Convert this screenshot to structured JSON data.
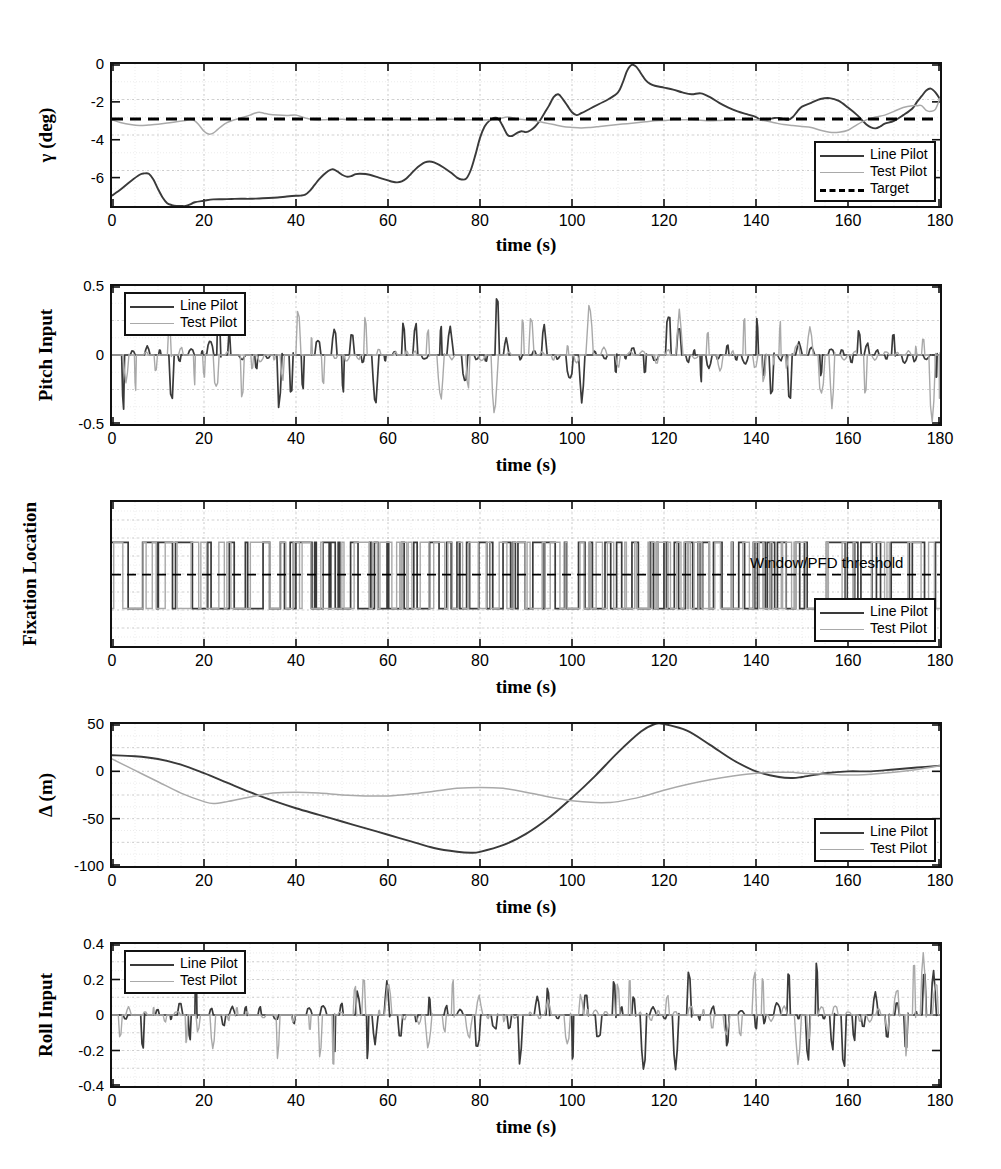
{
  "figure": {
    "shared_xlabel": "time (s)",
    "xticks": [
      0,
      20,
      40,
      60,
      80,
      100,
      120,
      140,
      160,
      180
    ],
    "xlim": [
      0,
      180
    ],
    "series_names": {
      "line": "Line Pilot",
      "test": "Test Pilot",
      "target": "Target"
    },
    "colors": {
      "line_pilot": "#3a3a3a",
      "test_pilot": "#a9a9a9",
      "target": "#000000",
      "grid": "#d8d8d8",
      "axis": "#111111"
    }
  },
  "chart_data": [
    {
      "id": "gamma",
      "type": "line",
      "title": "",
      "xlabel": "time (s)",
      "ylabel": "γ (deg)",
      "xlim": [
        0,
        180
      ],
      "ylim": [
        -7.5,
        0
      ],
      "xticks": [
        0,
        20,
        40,
        60,
        80,
        100,
        120,
        140,
        160,
        180
      ],
      "yticks": [
        0,
        -2,
        -4,
        -6
      ],
      "grid": true,
      "legend": {
        "position": "bottom-right",
        "entries": [
          "Line Pilot",
          "Test Pilot",
          "Target"
        ]
      },
      "series": [
        {
          "name": "Line Pilot",
          "style": "solid-dark",
          "x": [
            0,
            2,
            4,
            6,
            7,
            8,
            9,
            10,
            11,
            12,
            13,
            14,
            15,
            16,
            17,
            18,
            20,
            22,
            24,
            26,
            28,
            30,
            32,
            34,
            36,
            38,
            40,
            41,
            42,
            43,
            44,
            45,
            46,
            47,
            48,
            49,
            50,
            51,
            52,
            53,
            54,
            56,
            58,
            60,
            61,
            62,
            63,
            64,
            65,
            66,
            67,
            68,
            69,
            70,
            72,
            74,
            75,
            76,
            77,
            78,
            79,
            80,
            81,
            82,
            83,
            84,
            85,
            86,
            87,
            88,
            89,
            90,
            91,
            92,
            93,
            94,
            95,
            96,
            97,
            98,
            99,
            100,
            101,
            102,
            104,
            106,
            108,
            110,
            111,
            112,
            113,
            114,
            115,
            116,
            117,
            118,
            120,
            122,
            124,
            126,
            128,
            130,
            132,
            134,
            136,
            138,
            140,
            141,
            142,
            143,
            144,
            145,
            146,
            147,
            148,
            149,
            150,
            152,
            154,
            156,
            158,
            160,
            162,
            163,
            164,
            165,
            166,
            167,
            168,
            170,
            172,
            174,
            175,
            176,
            177,
            178,
            179,
            180
          ],
          "y": [
            -6.95,
            -6.6,
            -6.2,
            -5.85,
            -5.78,
            -5.8,
            -6.1,
            -6.6,
            -7.05,
            -7.35,
            -7.45,
            -7.5,
            -7.5,
            -7.5,
            -7.42,
            -7.3,
            -7.22,
            -7.15,
            -7.14,
            -7.13,
            -7.12,
            -7.12,
            -7.1,
            -7.08,
            -7.05,
            -7.0,
            -6.96,
            -6.95,
            -6.9,
            -6.7,
            -6.4,
            -6.1,
            -5.85,
            -5.65,
            -5.55,
            -5.68,
            -5.85,
            -5.95,
            -5.92,
            -5.82,
            -5.8,
            -5.85,
            -6.0,
            -6.15,
            -6.22,
            -6.25,
            -6.2,
            -6.05,
            -5.8,
            -5.55,
            -5.35,
            -5.2,
            -5.15,
            -5.2,
            -5.45,
            -5.8,
            -6.0,
            -6.1,
            -6.05,
            -5.6,
            -4.8,
            -3.9,
            -3.3,
            -3.0,
            -2.85,
            -2.9,
            -3.3,
            -3.75,
            -3.8,
            -3.65,
            -3.55,
            -3.6,
            -3.5,
            -3.3,
            -3.0,
            -2.6,
            -2.2,
            -1.75,
            -1.6,
            -1.85,
            -2.2,
            -2.55,
            -2.7,
            -2.6,
            -2.35,
            -2.1,
            -1.85,
            -1.5,
            -1.0,
            -0.35,
            -0.05,
            -0.15,
            -0.5,
            -0.85,
            -1.05,
            -1.15,
            -1.25,
            -1.35,
            -1.5,
            -1.6,
            -1.55,
            -1.75,
            -2.05,
            -2.3,
            -2.5,
            -2.65,
            -2.8,
            -2.95,
            -2.95,
            -2.9,
            -2.85,
            -2.85,
            -2.9,
            -2.95,
            -2.8,
            -2.5,
            -2.25,
            -2.05,
            -1.85,
            -1.8,
            -1.95,
            -2.3,
            -2.7,
            -2.95,
            -3.2,
            -3.35,
            -3.4,
            -3.3,
            -3.15,
            -3.0,
            -2.7,
            -2.35,
            -2.0,
            -1.7,
            -1.4,
            -1.3,
            -1.5,
            -1.85
          ]
        },
        {
          "name": "Test Pilot",
          "style": "solid-light",
          "x": [
            0,
            2,
            4,
            6,
            8,
            10,
            12,
            14,
            16,
            17,
            18,
            19,
            20,
            21,
            22,
            23,
            24,
            25,
            26,
            28,
            30,
            31,
            32,
            33,
            34,
            36,
            38,
            40,
            42,
            44,
            46,
            48,
            50,
            52,
            54,
            56,
            58,
            60,
            62,
            64,
            66,
            68,
            70,
            72,
            74,
            76,
            78,
            80,
            82,
            84,
            86,
            88,
            90,
            92,
            94,
            96,
            98,
            100,
            102,
            104,
            106,
            108,
            110,
            112,
            114,
            116,
            118,
            120,
            122,
            124,
            126,
            128,
            130,
            132,
            134,
            136,
            138,
            140,
            142,
            144,
            146,
            148,
            150,
            152,
            154,
            156,
            158,
            160,
            162,
            164,
            166,
            168,
            170,
            172,
            174,
            175,
            176,
            177,
            178,
            179,
            180
          ],
          "y": [
            -2.95,
            -3.1,
            -3.2,
            -3.25,
            -3.22,
            -3.18,
            -3.12,
            -3.05,
            -2.98,
            -2.95,
            -3.0,
            -3.25,
            -3.55,
            -3.7,
            -3.65,
            -3.45,
            -3.25,
            -3.1,
            -3.0,
            -2.85,
            -2.7,
            -2.6,
            -2.55,
            -2.6,
            -2.65,
            -2.7,
            -2.72,
            -2.7,
            -2.85,
            -2.95,
            -2.95,
            -2.9,
            -2.92,
            -2.95,
            -2.95,
            -2.95,
            -2.95,
            -2.95,
            -2.95,
            -2.95,
            -2.95,
            -2.95,
            -2.95,
            -2.92,
            -2.92,
            -2.95,
            -2.95,
            -2.95,
            -2.95,
            -2.9,
            -2.8,
            -2.9,
            -2.95,
            -3.0,
            -3.1,
            -3.2,
            -3.3,
            -3.35,
            -3.38,
            -3.35,
            -3.3,
            -3.25,
            -3.2,
            -3.15,
            -3.1,
            -3.05,
            -3.0,
            -2.98,
            -2.95,
            -2.95,
            -2.95,
            -2.97,
            -3.0,
            -2.98,
            -2.95,
            -2.95,
            -2.95,
            -2.95,
            -3.0,
            -3.1,
            -3.2,
            -3.25,
            -3.3,
            -3.35,
            -3.5,
            -3.6,
            -3.6,
            -3.5,
            -3.2,
            -2.95,
            -2.8,
            -2.7,
            -2.5,
            -2.3,
            -2.2,
            -2.2,
            -2.2,
            -2.45,
            -2.5,
            -2.4,
            -1.8
          ]
        },
        {
          "name": "Target",
          "style": "dashed",
          "x": [
            0,
            180
          ],
          "y": [
            -2.9,
            -2.9
          ]
        }
      ]
    },
    {
      "id": "pitch_input",
      "type": "line",
      "ylabel": "Pitch Input",
      "xlabel": "time (s)",
      "xlim": [
        0,
        180
      ],
      "ylim": [
        -0.5,
        0.5
      ],
      "yticks": [
        0.5,
        0,
        -0.5
      ],
      "xticks": [
        0,
        20,
        40,
        60,
        80,
        100,
        120,
        140,
        160,
        180
      ],
      "grid": true,
      "legend": {
        "position": "top-left",
        "entries": [
          "Line Pilot",
          "Test Pilot"
        ]
      },
      "description": "Sparse bipolar impulse train of pilot pitch stick inputs; Line Pilot peaks near +0.25 at t=76 and -0.45 at t=83; Test Pilot peaks near +0.5 at t=178."
    },
    {
      "id": "fixation_location",
      "type": "line",
      "ylabel": "Fixation Location",
      "xlabel": "time (s)",
      "xlim": [
        0,
        180
      ],
      "ylim": [
        0,
        1
      ],
      "yticks": [],
      "xticks": [
        0,
        20,
        40,
        60,
        80,
        100,
        120,
        140,
        160,
        180
      ],
      "grid": true,
      "legend": {
        "position": "bottom-right",
        "entries": [
          "Line Pilot",
          "Test Pilot"
        ]
      },
      "annotation": "Window/PFD threshold",
      "description": "Binary square-wave gaze trace toggling between an upper (Window) level and a lower (PFD) level, with a dashed horizontal threshold line midway."
    },
    {
      "id": "delta",
      "type": "line",
      "ylabel": "Δ (m)",
      "xlabel": "time (s)",
      "xlim": [
        0,
        180
      ],
      "ylim": [
        -100,
        50
      ],
      "yticks": [
        50,
        0,
        -50,
        -100
      ],
      "xticks": [
        0,
        20,
        40,
        60,
        80,
        100,
        120,
        140,
        160,
        180
      ],
      "grid": true,
      "legend": {
        "position": "bottom-right",
        "entries": [
          "Line Pilot",
          "Test Pilot"
        ]
      },
      "series": [
        {
          "name": "Line Pilot",
          "style": "solid-dark",
          "x": [
            0,
            5,
            10,
            15,
            20,
            25,
            30,
            35,
            40,
            45,
            50,
            55,
            60,
            65,
            70,
            75,
            78,
            80,
            85,
            90,
            95,
            100,
            105,
            110,
            115,
            118,
            120,
            125,
            130,
            135,
            140,
            145,
            148,
            150,
            155,
            160,
            165,
            170,
            175,
            180
          ],
          "y": [
            17,
            16,
            13,
            7,
            -2,
            -12,
            -22,
            -31,
            -39,
            -46,
            -53,
            -60,
            -67,
            -74,
            -81,
            -85,
            -86,
            -85,
            -78,
            -66,
            -49,
            -28,
            -5,
            20,
            42,
            50,
            50,
            43,
            28,
            12,
            0,
            -6,
            -7,
            -6,
            -2,
            0,
            0,
            2,
            4,
            6
          ]
        },
        {
          "name": "Test Pilot",
          "style": "solid-light",
          "x": [
            0,
            5,
            10,
            15,
            20,
            22,
            25,
            30,
            35,
            40,
            45,
            50,
            55,
            60,
            65,
            70,
            75,
            80,
            85,
            90,
            95,
            100,
            105,
            108,
            110,
            115,
            120,
            125,
            130,
            135,
            140,
            145,
            148,
            150,
            155,
            160,
            165,
            170,
            175,
            180
          ],
          "y": [
            13,
            1,
            -11,
            -23,
            -32,
            -34,
            -32,
            -27,
            -23,
            -22,
            -23,
            -25,
            -26,
            -26,
            -24,
            -21,
            -18,
            -17,
            -18,
            -22,
            -27,
            -31,
            -33,
            -33,
            -32,
            -27,
            -20,
            -14,
            -9,
            -5,
            -2,
            -1,
            -1,
            -2,
            -3,
            -4,
            -3,
            -1,
            2,
            6
          ]
        }
      ]
    },
    {
      "id": "roll_input",
      "type": "line",
      "ylabel": "Roll Input",
      "xlabel": "time (s)",
      "xlim": [
        0,
        180
      ],
      "ylim": [
        -0.4,
        0.4
      ],
      "yticks": [
        0.4,
        0.2,
        0,
        -0.2,
        -0.4
      ],
      "xticks": [
        0,
        20,
        40,
        60,
        80,
        100,
        120,
        140,
        160,
        180
      ],
      "grid": true,
      "legend": {
        "position": "top-left",
        "entries": [
          "Line Pilot",
          "Test Pilot"
        ]
      },
      "description": "Sparse bipolar impulse train of pilot roll stick inputs; Line Pilot peaks near +0.24 at t=70 and -0.2 at t=5; Test Pilot peaks near +0.32 at t=175 and -0.22 at t=22."
    }
  ]
}
